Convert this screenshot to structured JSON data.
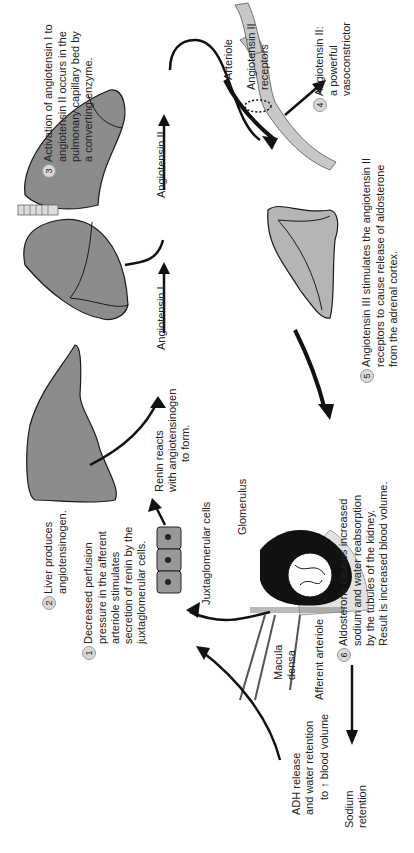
{
  "diagram": {
    "orientation": "rotated 90deg counterclockwise",
    "steps": [
      {
        "number": "1",
        "lines": [
          "Decreased perfusion",
          "pressure in the afferent",
          "arteriole stimulates",
          "secretion of renin by the",
          "juxtaglomerular cells."
        ]
      },
      {
        "number": "2",
        "lines": [
          "Liver produces",
          "angiotensinogen."
        ]
      },
      {
        "number": "3",
        "lines": [
          "Activation of angiotensin I to",
          "angiotensin II occurs in the",
          "pulmonary capillary bed by",
          "a converting enzyme."
        ]
      },
      {
        "number": "4",
        "lines": [
          "Angiotensin II:",
          "a powerful",
          "vasoconstrictor"
        ]
      },
      {
        "number": "5",
        "lines": [
          "Angiotensin III stimulates the angiotensin II",
          "receptors to cause release of aldosterone",
          "from the adrenal cortex."
        ]
      },
      {
        "number": "6",
        "lines": [
          "Aldosterone causes increased",
          "sodium and water reabsorption",
          "by the tubules of the kidney.",
          "Result is increased blood volume."
        ]
      }
    ],
    "labels": {
      "renin": [
        "Renin reacts",
        "with angiotensinogen",
        "to form."
      ],
      "angiotensin_1": "Angiotensin I",
      "angiotensin_2": "Angiotensin II",
      "arteriole": "Arteriole",
      "receptors": [
        "Angiotensin II",
        "receptors"
      ],
      "juxtaglomerular": "Juxtaglomerular cells",
      "glomerulus": "Glomerulus",
      "macula_densa": [
        "Macula",
        "densa"
      ],
      "afferent_arteriole": "Afferent arteriole",
      "adh": [
        "ADH release",
        "and water retention"
      ],
      "blood_volume": "to ↑ blood volume",
      "sodium": [
        "Sodium",
        "retention"
      ]
    },
    "colors": {
      "organ_fill": "#8c8c8c",
      "organ_light": "#b5b5b5",
      "outline": "#1a1a1a",
      "badge": "#d8d8d8"
    }
  }
}
